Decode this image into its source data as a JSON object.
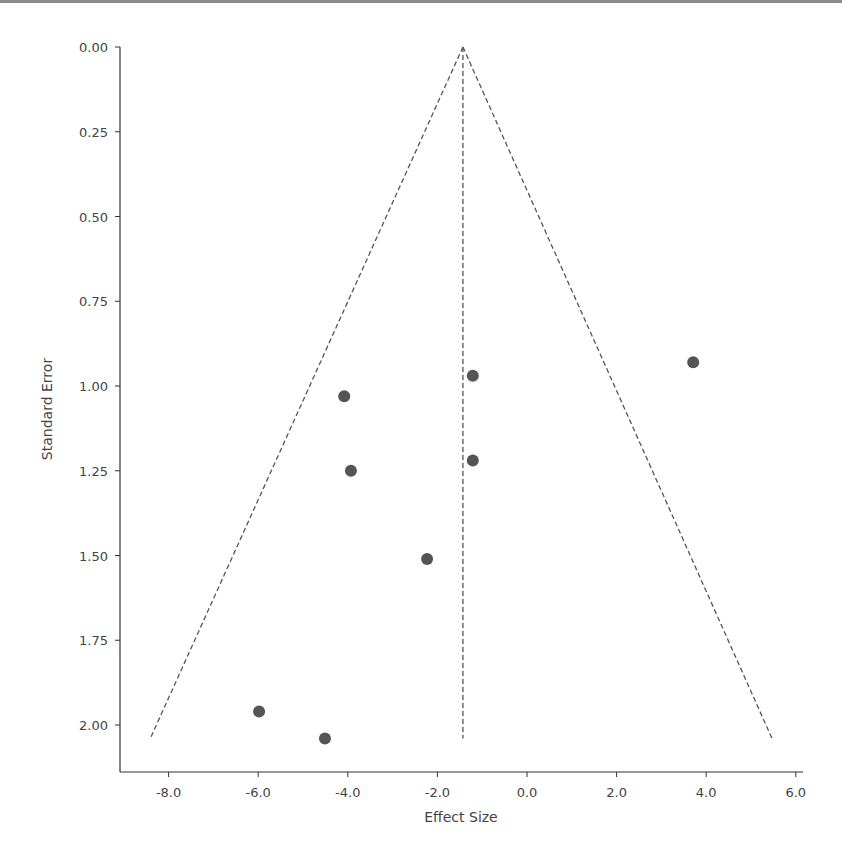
{
  "chart_data": {
    "type": "scatter",
    "subtype": "funnel-plot",
    "title": "",
    "xlabel": "Effect Size",
    "ylabel": "Standard Error",
    "xlim": [
      -9.0,
      6.2
    ],
    "ylim": [
      2.15,
      0.0
    ],
    "y_inverted": true,
    "grid": false,
    "legend": null,
    "x_ticks": [
      -8.0,
      -6.0,
      -4.0,
      -2.0,
      0.0,
      2.0,
      4.0,
      6.0
    ],
    "x_tick_labels": [
      "-8.0",
      "-6.0",
      "-4.0",
      "-2.0",
      "0.0",
      "2.0",
      "4.0",
      "6.0"
    ],
    "y_ticks": [
      0.0,
      0.25,
      0.5,
      0.75,
      1.0,
      1.25,
      1.5,
      1.75,
      2.0
    ],
    "y_tick_labels": [
      "0.00",
      "0.25",
      "0.50",
      "0.75",
      "1.00",
      "1.25",
      "1.50",
      "1.75",
      "2.00"
    ],
    "points": [
      {
        "x": 3.71,
        "y": 0.93
      },
      {
        "x": -1.21,
        "y": 0.97
      },
      {
        "x": -4.08,
        "y": 1.03
      },
      {
        "x": -1.21,
        "y": 1.22
      },
      {
        "x": -3.93,
        "y": 1.25
      },
      {
        "x": -2.23,
        "y": 1.51
      },
      {
        "x": -5.98,
        "y": 1.96
      },
      {
        "x": -4.51,
        "y": 2.04
      }
    ],
    "pooled_effect": -1.43,
    "funnel": {
      "apex": {
        "x": -1.43,
        "y": 0.0
      },
      "left_end": {
        "x": -8.41,
        "y": 2.04
      },
      "right_end": {
        "x": 5.47,
        "y": 2.04
      }
    },
    "colors": {
      "points": "#555555",
      "lines": "#555555",
      "axes": "#333333"
    }
  }
}
